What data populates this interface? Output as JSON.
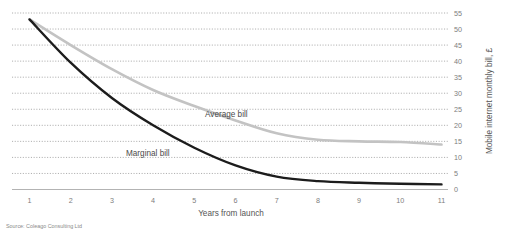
{
  "chart_data": {
    "type": "line",
    "title": "",
    "subtitle": "",
    "xlabel": "Years from launch",
    "ylabel": "Mobile internet monthly bill, £",
    "x": [
      1,
      2,
      3,
      4,
      5,
      6,
      7,
      8,
      9,
      10,
      11
    ],
    "xticklabels": [
      "1",
      "2",
      "3",
      "4",
      "5",
      "6",
      "7",
      "8",
      "9",
      "10",
      "11"
    ],
    "xlim": [
      1,
      11
    ],
    "ylim": [
      0,
      55
    ],
    "yticks": [
      0,
      5,
      10,
      15,
      20,
      25,
      30,
      35,
      40,
      45,
      50,
      55
    ],
    "yticklabels": [
      "0",
      "5",
      "10",
      "15",
      "20",
      "25",
      "30",
      "35",
      "40",
      "45",
      "50",
      "55"
    ],
    "grid": "horizontal-dotted",
    "legend": "inline-labels",
    "series": [
      {
        "name": "Average bill",
        "color": "#c3c3c3",
        "label_position": "inline-right-of-line",
        "values": [
          53,
          45,
          37.5,
          31,
          26,
          21.5,
          17.5,
          15.5,
          15,
          14.8,
          14
        ]
      },
      {
        "name": "Marginal bill",
        "color": "#1c1c1c",
        "label_position": "inline-above-line",
        "values": [
          53,
          39.5,
          28.5,
          20,
          13,
          7.5,
          4,
          2.6,
          2.1,
          1.8,
          1.6
        ]
      }
    ],
    "annotations": [
      {
        "text": "Average bill",
        "series": "Average bill"
      },
      {
        "text": "Marginal bill",
        "series": "Marginal bill"
      }
    ],
    "source": "Source: Coleago Consulting Ltd"
  },
  "labels": {
    "average_bill": "Average bill",
    "marginal_bill": "Marginal bill",
    "x_axis_title": "Years from launch",
    "y_axis_title": "Mobile internet monthly bill, £",
    "source": "Source: Coleago Consulting Ltd"
  },
  "colors": {
    "average_bill": "#c3c3c3",
    "marginal_bill": "#1c1c1c",
    "grid": "#9a9a9a",
    "axis": "#b3b3b3",
    "text": "#7d7d7d",
    "background": "#ffffff"
  }
}
